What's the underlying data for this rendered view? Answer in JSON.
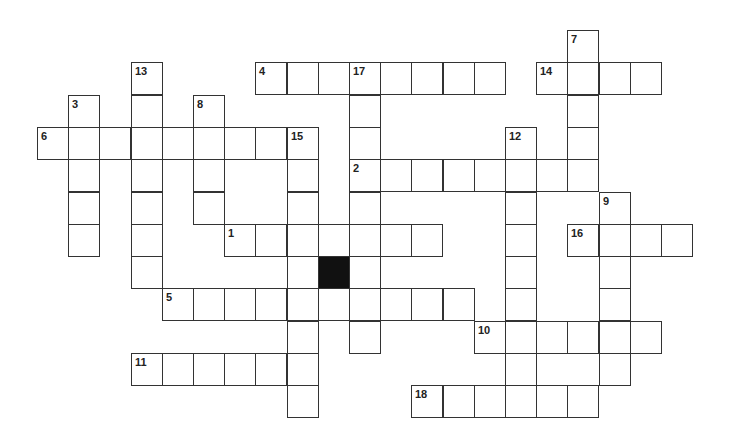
{
  "puzzle": {
    "origin": {
      "x": 37,
      "y": 30
    },
    "cell": {
      "w": 31.2,
      "h": 32.3
    },
    "colors": {
      "border": "#333333",
      "fill": "#ffffff",
      "block": "#111111",
      "number": "#222222"
    },
    "black_cells": [
      [
        7,
        9
      ]
    ],
    "entries": [
      {
        "number": "1",
        "direction": "across",
        "row": 6,
        "col": 6,
        "length": 7
      },
      {
        "number": "2",
        "direction": "across",
        "row": 4,
        "col": 10,
        "length": 8
      },
      {
        "number": "3",
        "direction": "down",
        "row": 2,
        "col": 1,
        "length": 5
      },
      {
        "number": "4",
        "direction": "across",
        "row": 1,
        "col": 7,
        "length": 8
      },
      {
        "number": "5",
        "direction": "across",
        "row": 8,
        "col": 4,
        "length": 10
      },
      {
        "number": "6",
        "direction": "across",
        "row": 3,
        "col": 0,
        "length": 9
      },
      {
        "number": "7",
        "direction": "down",
        "row": 0,
        "col": 17,
        "length": 5
      },
      {
        "number": "8",
        "direction": "down",
        "row": 2,
        "col": 5,
        "length": 4
      },
      {
        "number": "9",
        "direction": "down",
        "row": 5,
        "col": 18,
        "length": 6
      },
      {
        "number": "10",
        "direction": "across",
        "row": 9,
        "col": 14,
        "length": 6
      },
      {
        "number": "11",
        "direction": "across",
        "row": 10,
        "col": 3,
        "length": 6
      },
      {
        "number": "12",
        "direction": "down",
        "row": 3,
        "col": 15,
        "length": 9
      },
      {
        "number": "13",
        "direction": "down",
        "row": 1,
        "col": 3,
        "length": 7
      },
      {
        "number": "14",
        "direction": "across",
        "row": 1,
        "col": 16,
        "length": 4
      },
      {
        "number": "15",
        "direction": "down",
        "row": 3,
        "col": 8,
        "length": 9
      },
      {
        "number": "16",
        "direction": "across",
        "row": 6,
        "col": 17,
        "length": 4
      },
      {
        "number": "17",
        "direction": "down",
        "row": 1,
        "col": 10,
        "length": 9
      },
      {
        "number": "18",
        "direction": "across",
        "row": 11,
        "col": 12,
        "length": 6
      }
    ]
  }
}
